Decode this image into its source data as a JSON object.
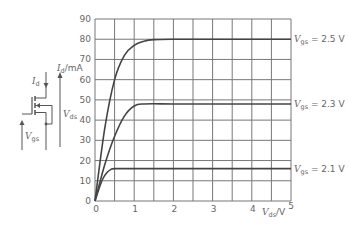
{
  "chart_data": {
    "type": "line",
    "title": "",
    "xlabel": "V_ds/V",
    "ylabel": "I_d/mA",
    "xlim": [
      0,
      5
    ],
    "ylim": [
      0,
      90
    ],
    "x_ticks": [
      "0",
      "1",
      "2",
      "3",
      "4",
      "5"
    ],
    "y_ticks": [
      "0",
      "10",
      "20",
      "30",
      "40",
      "50",
      "60",
      "70",
      "80",
      "90"
    ],
    "grid": true,
    "grid_x_step": 0.5,
    "grid_y_step": 10,
    "legend_position": "right-inline",
    "series": [
      {
        "name": "V_gs = 2.5 V",
        "label_var": "V",
        "label_sub": "gs",
        "label_val": " = 2.5 V",
        "x": [
          0,
          0.25,
          0.5,
          0.75,
          1.0,
          1.25,
          1.5,
          2.0,
          3.0,
          4.0,
          5.0
        ],
        "y": [
          0,
          36,
          60,
          72,
          77,
          79,
          79.8,
          80,
          80,
          80,
          80
        ]
      },
      {
        "name": "V_gs = 2.3 V",
        "label_var": "V",
        "label_sub": "gs",
        "label_val": " = 2.3 V",
        "x": [
          0,
          0.25,
          0.5,
          0.75,
          1.0,
          1.25,
          2.0,
          3.0,
          4.0,
          5.0
        ],
        "y": [
          0,
          18,
          32,
          42,
          47,
          48,
          48,
          48,
          48,
          48
        ]
      },
      {
        "name": "V_gs = 2.1 V",
        "label_var": "V",
        "label_sub": "gs",
        "label_val": " = 2.1 V",
        "x": [
          0,
          0.1,
          0.2,
          0.3,
          0.4,
          0.5,
          1.0,
          2.0,
          3.0,
          4.0,
          5.0
        ],
        "y": [
          0,
          6,
          11,
          14,
          15.5,
          16,
          16,
          16,
          16,
          16,
          16
        ]
      }
    ],
    "annotations": [
      "Circuit: MOSFET with I_d, V_gs, V_ds indicated"
    ]
  },
  "axes": {
    "ylabel_var": "I",
    "ylabel_sub": "d",
    "ylabel_unit": "/mA",
    "xlabel_var": "V",
    "xlabel_sub": "ds",
    "xlabel_unit": "/V"
  },
  "circuit": {
    "id_var": "I",
    "id_sub": "d",
    "vds_var": "V",
    "vds_sub": "ds",
    "vgs_var": "V",
    "vgs_sub": "gs"
  }
}
